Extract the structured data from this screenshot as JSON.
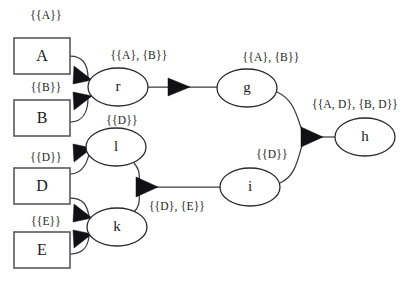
{
  "diagram": {
    "type": "dataflow-provenance-graph",
    "background_color": "#ffffff",
    "box_stroke_color": "#59595c",
    "ellipse_stroke_color": "#2b2b2e",
    "edge_color": "#3a3a3d",
    "arrow_color": "#111113",
    "text_color": "#1a1a1c",
    "source_nodes": [
      {
        "id": "A",
        "label": "A",
        "shape": "rectangle",
        "x": 14,
        "y": 38,
        "w": 56,
        "h": 36
      },
      {
        "id": "B",
        "label": "B",
        "shape": "rectangle",
        "x": 14,
        "y": 100,
        "w": 56,
        "h": 36
      },
      {
        "id": "D",
        "label": "D",
        "shape": "rectangle",
        "x": 14,
        "y": 168,
        "w": 56,
        "h": 36
      },
      {
        "id": "E",
        "label": "E",
        "shape": "rectangle",
        "x": 14,
        "y": 232,
        "w": 56,
        "h": 36
      }
    ],
    "process_nodes": [
      {
        "id": "r",
        "label": "r",
        "shape": "ellipse",
        "cx": 118,
        "cy": 87,
        "rx": 30,
        "ry": 19
      },
      {
        "id": "l",
        "label": "l",
        "shape": "ellipse",
        "cx": 116,
        "cy": 147,
        "rx": 30,
        "ry": 19
      },
      {
        "id": "k",
        "label": "k",
        "shape": "ellipse",
        "cx": 117,
        "cy": 227,
        "rx": 30,
        "ry": 19
      },
      {
        "id": "g",
        "label": "g",
        "shape": "ellipse",
        "cx": 247,
        "cy": 88,
        "rx": 30,
        "ry": 19
      },
      {
        "id": "i",
        "label": "i",
        "shape": "ellipse",
        "cx": 250,
        "cy": 187,
        "rx": 30,
        "ry": 19
      },
      {
        "id": "h",
        "label": "h",
        "shape": "ellipse",
        "cx": 365,
        "cy": 137,
        "rx": 30,
        "ry": 19
      }
    ],
    "edge_labels": [
      {
        "id": "label-a",
        "text": "{{A}}",
        "x": 46,
        "y": 16
      },
      {
        "id": "label-b",
        "text": "{{B}}",
        "x": 46,
        "y": 88
      },
      {
        "id": "label-d-box",
        "text": "{{D}}",
        "x": 46,
        "y": 158
      },
      {
        "id": "label-e",
        "text": "{{E}}",
        "x": 46,
        "y": 222
      },
      {
        "id": "label-r-out",
        "text": "{{A}, {B}}",
        "x": 139,
        "y": 56
      },
      {
        "id": "label-l-in",
        "text": "{{D}}",
        "x": 122,
        "y": 121
      },
      {
        "id": "label-k-out",
        "text": "{{D}, {E}}",
        "x": 177,
        "y": 207
      },
      {
        "id": "label-g-out",
        "text": "{{A}, {B}}",
        "x": 271,
        "y": 58
      },
      {
        "id": "label-i-out",
        "text": "{{D}}",
        "x": 272,
        "y": 155
      },
      {
        "id": "label-h-in",
        "text": "{{A, D}, {B, D}}",
        "x": 355,
        "y": 105
      }
    ],
    "edges": [
      {
        "id": "edge-a-r",
        "from": "A",
        "to": "r",
        "label": "{{A}}"
      },
      {
        "id": "edge-b-r",
        "from": "B",
        "to": "r",
        "label": "{{B}}"
      },
      {
        "id": "edge-r-g",
        "from": "r",
        "to": "g",
        "label": "{{A}, {B}}"
      },
      {
        "id": "edge-d-l",
        "from": "D",
        "to": "l",
        "label": "{{D}}"
      },
      {
        "id": "edge-d-k",
        "from": "D",
        "to": "k",
        "label": "{{D}}"
      },
      {
        "id": "edge-e-k",
        "from": "E",
        "to": "k",
        "label": "{{E}}"
      },
      {
        "id": "edge-l-i",
        "from": "l",
        "to": "i",
        "label": "{{D}, {E}}"
      },
      {
        "id": "edge-k-i",
        "from": "k",
        "to": "i",
        "label": "{{D}, {E}}"
      },
      {
        "id": "edge-g-h",
        "from": "g",
        "to": "h",
        "label": "{{A, D}, {B, D}}"
      },
      {
        "id": "edge-i-h",
        "from": "i",
        "to": "h",
        "label": "{{D}}"
      }
    ]
  }
}
